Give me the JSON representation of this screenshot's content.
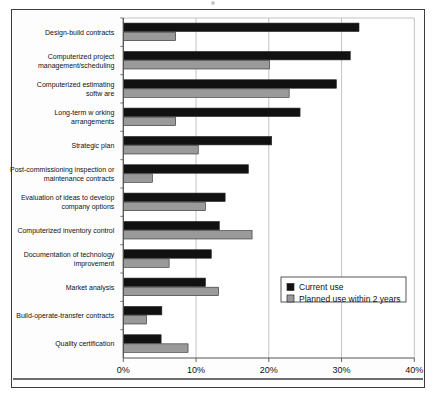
{
  "figure": {
    "border_color": "#3d3d3d",
    "background": "#ffffff"
  },
  "chart_data": {
    "type": "bar",
    "orientation": "horizontal",
    "title": "",
    "xlabel": "",
    "ylabel": "",
    "xlim": [
      0,
      40
    ],
    "xticks": [
      "0%",
      "10%",
      "20%",
      "30%",
      "40%"
    ],
    "xtick_values": [
      0,
      10,
      20,
      30,
      40
    ],
    "grid": true,
    "grid_axis": "x",
    "legend_position": "center-right",
    "categories": [
      "Design-build contracts",
      "Computerized project management/scheduling",
      "Computerized estimating software",
      "Long-term working arrangements",
      "Strategic plan",
      "Post-commissioning inspection or maintenance contracts",
      "Evaluation of ideas to develop company options",
      "Computerized inventory control",
      "Documentation of technology improvement",
      "Market analysis",
      "Build-operate-transfer contracts",
      "Quality certification"
    ],
    "category_lines": [
      [
        "Design-build contracts"
      ],
      [
        "Computerized project",
        "management/scheduling"
      ],
      [
        "Computerized estimating",
        "softw are"
      ],
      [
        "Long-term w orking",
        "arrangements"
      ],
      [
        "Strategic plan"
      ],
      [
        "Post-commissioning inspection or",
        "maintenance contracts"
      ],
      [
        "Evaluation of ideas to develop",
        "company options"
      ],
      [
        "Computerized inventory control"
      ],
      [
        "Documentation of technology",
        "improvement"
      ],
      [
        "Market analysis"
      ],
      [
        "Build-operate-transfer  contracts"
      ],
      [
        "Quality certification"
      ]
    ],
    "series": [
      {
        "name": "Current use",
        "color": "#111111",
        "values": [
          32.4,
          31.2,
          29.3,
          24.3,
          20.4,
          17.2,
          14.0,
          13.2,
          12.1,
          11.3,
          5.3,
          5.2
        ]
      },
      {
        "name": "Planned use within 2 years",
        "color": "#9a9a9a",
        "values": [
          7.2,
          20.1,
          22.8,
          7.2,
          10.3,
          4.0,
          11.3,
          17.7,
          6.3,
          13.1,
          3.2,
          8.9
        ]
      }
    ]
  },
  "legend": {
    "entries": [
      {
        "label": "Current use",
        "color": "#111111"
      },
      {
        "label": "Planned use within 2 years",
        "color": "#9a9a9a"
      }
    ]
  }
}
